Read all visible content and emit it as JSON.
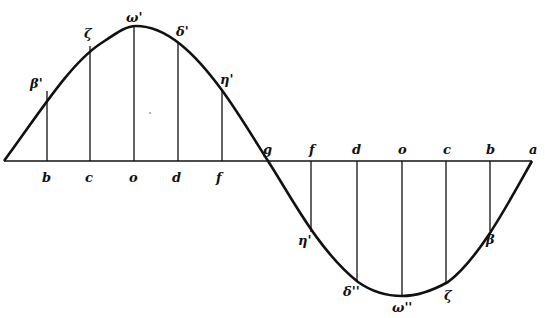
{
  "figure": {
    "caption_fragment": "",
    "stroke_color": "#111111",
    "background": "#ffffff"
  },
  "axis": {
    "left_end_x": 4,
    "right_end_x": 532,
    "y": 161,
    "zero_crossing_label": "g",
    "end_label": "a"
  },
  "upper_half": {
    "axis_labels": [
      "b",
      "c",
      "o",
      "d",
      "f"
    ],
    "axis_x": [
      47,
      90,
      134,
      178,
      222
    ],
    "curve_labels": [
      "β'",
      "ζ",
      "ω'",
      "δ'",
      "η'"
    ]
  },
  "lower_half": {
    "axis_labels": [
      "f",
      "d",
      "o",
      "c",
      "b"
    ],
    "axis_x": [
      311,
      357,
      402,
      446,
      490
    ],
    "curve_labels": [
      "η'",
      "δ''",
      "ω''",
      "ζ",
      "β"
    ]
  },
  "labels": {
    "g": "g",
    "a": "a",
    "b_up": "b",
    "c_up": "c",
    "o_up": "o",
    "d_up": "d",
    "f_up": "f",
    "beta_p": "β'",
    "zeta_up": "ζ",
    "omega_p": "ω'",
    "delta_p": "δ'",
    "eta_p": "η'",
    "f_lo": "f",
    "d_lo": "d",
    "o_lo": "o",
    "c_lo": "c",
    "b_lo": "b",
    "eta_lo": "η'",
    "delta_lo": "δ''",
    "omega_lo": "ω''",
    "zeta_lo": "ζ",
    "beta_lo": "β"
  }
}
